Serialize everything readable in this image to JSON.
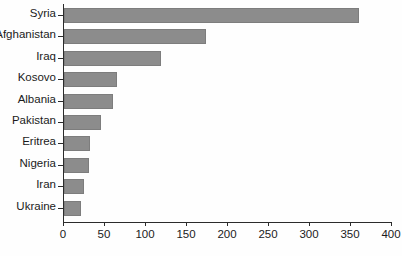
{
  "chart_data": {
    "type": "bar",
    "orientation": "horizontal",
    "title": "",
    "xlabel": "",
    "ylabel": "",
    "categories": [
      "Syria",
      "Afghanistan",
      "Iraq",
      "Kosovo",
      "Albania",
      "Pakistan",
      "Eritrea",
      "Nigeria",
      "Iran",
      "Ukraine"
    ],
    "values": [
      360,
      173,
      118,
      65,
      60,
      45,
      32,
      30,
      24,
      21
    ],
    "xlim": [
      0,
      400
    ],
    "xticks": [
      0,
      50,
      100,
      150,
      200,
      250,
      300,
      350,
      400
    ],
    "xtick_labels": [
      "0",
      "50",
      "100",
      "150",
      "200",
      "250",
      "300",
      "350",
      "400"
    ],
    "grid": false,
    "legend": false,
    "bar_color": "#8c8c8c",
    "bar_edge_color": "#7d7d7d",
    "axis_color": "#2b2b2b",
    "background_color": "#fefefe"
  }
}
